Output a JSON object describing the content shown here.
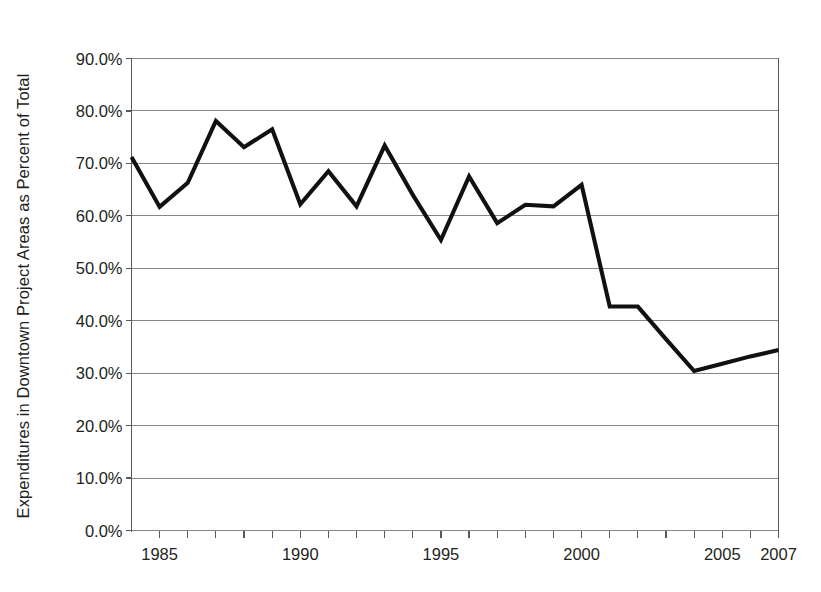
{
  "chart_data": {
    "type": "line",
    "title": "",
    "subtitle": "",
    "xlabel": "",
    "ylabel": "Expenditures in Downtown Project Areas as Percent of Total",
    "legend": [],
    "legend_position": "none",
    "grid": true,
    "grid_axis": "y",
    "xlim": [
      1984,
      2007
    ],
    "ylim": [
      0,
      90
    ],
    "y_tick_labels": [
      "0.0%",
      "10.0%",
      "20.0%",
      "30.0%",
      "40.0%",
      "50.0%",
      "60.0%",
      "70.0%",
      "80.0%",
      "90.0%"
    ],
    "y_tick_values": [
      0,
      10,
      20,
      30,
      40,
      50,
      60,
      70,
      80,
      90
    ],
    "x_tick_labels": [
      "1985",
      "1990",
      "1995",
      "2000",
      "2005",
      "2007"
    ],
    "x_tick_values": [
      1985,
      1990,
      1995,
      2000,
      2005,
      2007
    ],
    "x_minor_ticks_every": 1,
    "units": "percent",
    "series": [
      {
        "name": "Expenditures in Downtown Project Areas as Percent of Total",
        "color": "#111111",
        "x": [
          1984,
          1985,
          1986,
          1987,
          1988,
          1989,
          1990,
          1991,
          1992,
          1993,
          1994,
          1995,
          1996,
          1997,
          1998,
          1999,
          2000,
          2001,
          2002,
          2003,
          2004,
          2005,
          2006,
          2007
        ],
        "values": [
          71.2,
          61.7,
          66.3,
          78.1,
          73.1,
          76.5,
          62.2,
          68.5,
          61.8,
          73.4,
          64.0,
          55.4,
          67.5,
          58.6,
          62.1,
          61.8,
          65.9,
          42.7,
          42.7,
          36.5,
          30.4,
          31.8,
          33.2,
          34.4
        ]
      }
    ]
  },
  "axes": {
    "y_axis_title": "Expenditures in Downtown Project Areas as Percent of Total"
  }
}
